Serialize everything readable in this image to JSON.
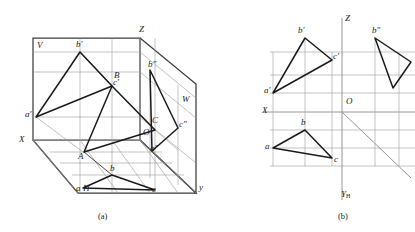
{
  "figure": {
    "type": "technical-drawing",
    "panels": [
      {
        "id": "a",
        "caption": "(a)",
        "description": "Pictorial view of the three projection planes V, H, W with spatial triangle ABC and its three projections",
        "plane_labels": [
          "V",
          "H",
          "W"
        ],
        "axis_labels": [
          "X",
          "Z",
          "y"
        ],
        "origin_label": "O",
        "space_points": [
          "A",
          "B",
          "C"
        ],
        "front_projection": [
          "a'",
          "b'",
          "c'"
        ],
        "top_projection": [
          "a",
          "b",
          "c"
        ],
        "side_projection": [
          "a\"",
          "b\"",
          "c\""
        ]
      },
      {
        "id": "b",
        "caption": "(b)",
        "description": "Unfolded two-dimensional projection drawing with X, Z and Y-H axes",
        "axis_labels": [
          "X",
          "Z",
          "YH"
        ],
        "y_axis_label_base": "Y",
        "y_axis_label_sub": "H",
        "origin_label": "O",
        "front_projection": [
          "a'",
          "b'",
          "c'"
        ],
        "top_projection": [
          "a",
          "b",
          "c"
        ],
        "side_projection": [
          "b\""
        ]
      }
    ],
    "labels": {
      "V": "V",
      "H": "H",
      "W": "W",
      "X": "X",
      "Z": "Z",
      "y_lower": "y",
      "O": "O",
      "A": "A",
      "B": "B",
      "C": "C",
      "a_front": "a′",
      "b_front": "b′",
      "c_front": "c′",
      "a_top": "a",
      "b_top": "b",
      "c_top": "c",
      "a_side": "a″",
      "b_side": "b″",
      "c_side": "c″",
      "cap_a": "(a)",
      "cap_b": "(b)"
    },
    "colors": {
      "heavy_line": "#1a1a1a",
      "thin_line": "#8a8a8a",
      "frame_line": "#3c3c3c",
      "background": "#ffffff",
      "text": "#1a1a1a"
    }
  }
}
